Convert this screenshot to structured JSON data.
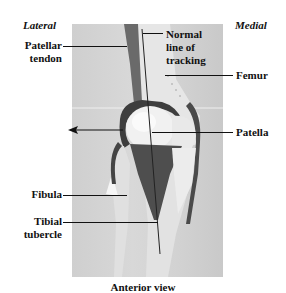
{
  "figure": {
    "caption": "Anterior view",
    "orientation": {
      "left": "Lateral",
      "right": "Medial"
    },
    "labels": {
      "patellar_tendon_line1": "Patellar",
      "patellar_tendon_line2": "tendon",
      "tracking_line1": "Normal",
      "tracking_line2": "line of",
      "tracking_line3": "tracking",
      "femur": "Femur",
      "patella": "Patella",
      "fibula": "Fibula",
      "tibial_tubercle_line1": "Tibial",
      "tibial_tubercle_line2": "tubercle"
    },
    "colors": {
      "background": "#ffffff",
      "photo_bg": "#d4d4d4",
      "bone": "#ececec",
      "tendon": "#5a5a5a",
      "text": "#111111"
    }
  }
}
